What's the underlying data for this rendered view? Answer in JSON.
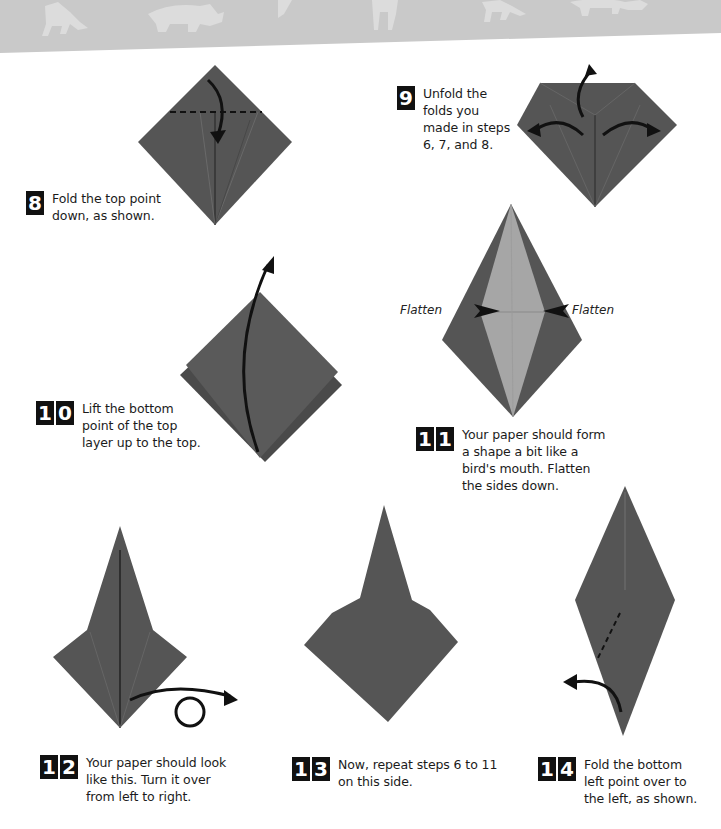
{
  "colors": {
    "paper": "#565656",
    "paper_light": "#8a8a8a",
    "paper_inner": "#a5a5a5",
    "header_band": "#c8c8c8",
    "header_silhouette": "#dedede",
    "arrow": "#111111"
  },
  "header": {
    "decoration": "animal-silhouettes-band",
    "silhouettes": [
      "fox",
      "rhino",
      "giraffe-neck",
      "giraffe-legs",
      "fox",
      "rhino"
    ]
  },
  "steps": [
    {
      "number": "8",
      "digits": [
        "8"
      ],
      "text": "Fold the top point\ndown, as shown."
    },
    {
      "number": "9",
      "digits": [
        "9"
      ],
      "text": "Unfold the\nfolds you\nmade in steps\n6, 7, and 8."
    },
    {
      "number": "10",
      "digits": [
        "1",
        "0"
      ],
      "text": "Lift the bottom\npoint of the top\nlayer up to the top."
    },
    {
      "number": "11",
      "digits": [
        "1",
        "1"
      ],
      "text": "Your paper should form\na shape a bit like a\nbird's mouth. Flatten\nthe sides down."
    },
    {
      "number": "12",
      "digits": [
        "1",
        "2"
      ],
      "text": "Your paper should look\nlike this. Turn it over\nfrom left to right."
    },
    {
      "number": "13",
      "digits": [
        "1",
        "3"
      ],
      "text": "Now, repeat steps 6 to 11\non this side."
    },
    {
      "number": "14",
      "digits": [
        "1",
        "4"
      ],
      "text": "Fold the bottom\nleft point over to\nthe left, as shown."
    }
  ],
  "labels": {
    "flatten_left": "Flatten",
    "flatten_right": "Flatten"
  }
}
